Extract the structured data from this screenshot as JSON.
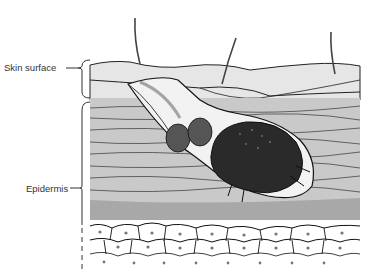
{
  "diagram": {
    "labels": [
      {
        "id": "skin-surface",
        "text": "Skin surface"
      },
      {
        "id": "epidermis",
        "text": "Epidermis"
      }
    ],
    "colors": {
      "background": "#ffffff",
      "surface_layer": "#e6e6e6",
      "epidermis_layer": "#c9c9c9",
      "granular_band": "#a8a8a8",
      "cell_fill": "#ffffff",
      "cell_outline": "#111111",
      "mite_body": "#2a2a2a",
      "eggs": "#555555",
      "ink": "#1a1a1a"
    }
  }
}
